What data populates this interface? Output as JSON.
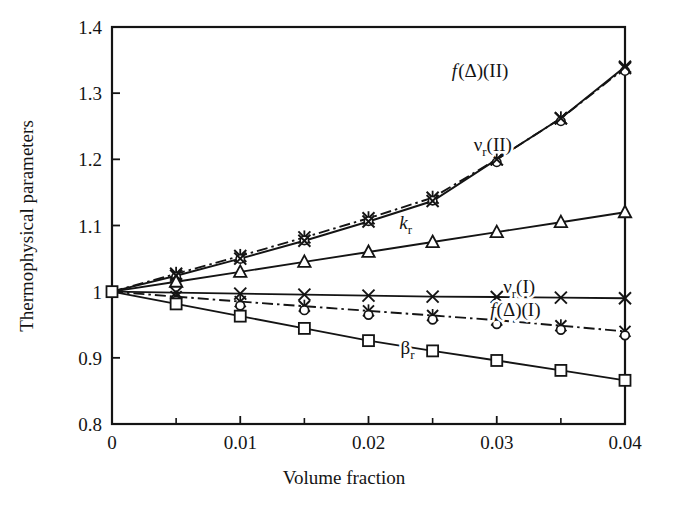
{
  "chart_data": {
    "type": "line",
    "title": "",
    "xlabel": "Volume fraction",
    "ylabel": "Thermophysical parameters",
    "xlim": [
      0,
      0.04
    ],
    "ylim": [
      0.8,
      1.4
    ],
    "xticks": [
      0,
      0.01,
      0.02,
      0.03,
      0.04
    ],
    "xtick_labels": [
      "0",
      "0.01",
      "0.02",
      "0.03",
      "0.04"
    ],
    "xminor_ticks": [
      0.005,
      0.015,
      0.025,
      0.035
    ],
    "yticks": [
      0.8,
      0.9,
      1.0,
      1.1,
      1.2,
      1.3,
      1.4
    ],
    "ytick_labels": [
      "0.8",
      "0.9",
      "1",
      "1.1",
      "1.2",
      "1.3",
      "1.4"
    ],
    "grid": false,
    "legend": "inline-annotations",
    "x": [
      0,
      0.005,
      0.01,
      0.015,
      0.02,
      0.025,
      0.03,
      0.035,
      0.04
    ],
    "series": [
      {
        "name": "f(Delta)(II)",
        "label_plain": "f(Δ)(II)",
        "marker": "star-x",
        "linestyle": "dashdot",
        "values": [
          1.0,
          1.027,
          1.054,
          1.082,
          1.111,
          1.142,
          1.2,
          1.262,
          1.338
        ]
      },
      {
        "name": "nu_r(II)",
        "label_plain": "ν_r(II)",
        "marker": "x",
        "linestyle": "solid",
        "values": [
          1.0,
          1.024,
          1.05,
          1.077,
          1.106,
          1.137,
          1.2,
          1.262,
          1.34
        ]
      },
      {
        "name": "k_r",
        "label_plain": "k_r",
        "marker": "triangle",
        "linestyle": "solid",
        "values": [
          1.0,
          1.015,
          1.03,
          1.045,
          1.06,
          1.075,
          1.09,
          1.105,
          1.12
        ]
      },
      {
        "name": "nu_r(I)",
        "label_plain": "ν_r(I)",
        "marker": "x",
        "linestyle": "solid",
        "values": [
          1.0,
          0.9985,
          0.997,
          0.9955,
          0.994,
          0.9925,
          0.992,
          0.991,
          0.99
        ]
      },
      {
        "name": "f(Delta)(I)",
        "label_plain": "f(Δ)(I)",
        "marker": "circle-star",
        "linestyle": "dashdot",
        "values": [
          1.0,
          0.9925,
          0.985,
          0.978,
          0.971,
          0.964,
          0.957,
          0.9485,
          0.94
        ]
      },
      {
        "name": "beta_r",
        "label_plain": "β_r",
        "marker": "square",
        "linestyle": "solid",
        "values": [
          1.0,
          0.9815,
          0.963,
          0.9445,
          0.926,
          0.9105,
          0.896,
          0.881,
          0.866
        ]
      }
    ]
  },
  "annotations": [
    {
      "id": "f-delta-II",
      "text_f": "f",
      "text_rest": "(Δ)(II)",
      "x": 0.0265,
      "y": 1.325
    },
    {
      "id": "nu-r-II",
      "text_main": "ν",
      "text_sub": "r",
      "text_rest": "(II)",
      "x": 0.0282,
      "y": 1.213
    },
    {
      "id": "k-r",
      "text_main": "k",
      "text_sub": "r",
      "x": 0.0224,
      "y": 1.095
    },
    {
      "id": "nu-r-I",
      "text_main": "ν",
      "text_sub": "r",
      "text_rest": "(I)",
      "x": 0.0305,
      "y": 0.9985
    },
    {
      "id": "f-delta-I",
      "text_f": "f",
      "text_rest": "(Δ)(I)",
      "x": 0.0295,
      "y": 0.9625
    },
    {
      "id": "beta-r",
      "text_main": "β",
      "text_sub": "r",
      "x": 0.0225,
      "y": 0.906
    }
  ],
  "style": {
    "line_color": "#141414",
    "frame_color": "#141414",
    "background": "#ffffff"
  }
}
